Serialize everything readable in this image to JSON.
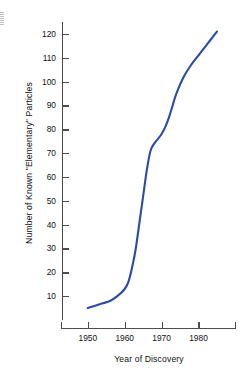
{
  "chart_data": {
    "type": "line",
    "title": "",
    "xlabel": "Year of Discovery",
    "ylabel": "Number of Known \"Elementary\" Particles",
    "xlim": [
      1943,
      1988
    ],
    "ylim": [
      0,
      125
    ],
    "xticks": [
      1950,
      1960,
      1970,
      1980
    ],
    "xtick_labels": [
      "1950",
      "1960",
      "1970",
      "1980"
    ],
    "yticks": [
      10,
      20,
      30,
      40,
      50,
      60,
      70,
      80,
      90,
      100,
      110,
      120
    ],
    "ytick_labels": [
      "10",
      "20",
      "30",
      "40",
      "50",
      "60",
      "70",
      "80",
      "90",
      "100",
      "110",
      "120"
    ],
    "grid": false,
    "legend": "none",
    "line_color": "#2B4BA8",
    "line_width": 2.1,
    "series": [
      {
        "name": "Known elementary particles",
        "x": [
          1950,
          1952,
          1954,
          1956,
          1958,
          1960,
          1961,
          1962,
          1963,
          1964,
          1965,
          1966,
          1967,
          1968,
          1969,
          1970,
          1971,
          1972,
          1973,
          1974,
          1976,
          1978,
          1980,
          1982,
          1985
        ],
        "y": [
          5,
          6,
          7,
          8,
          10,
          13,
          16,
          22,
          30,
          41,
          52,
          63,
          71,
          74,
          76,
          78,
          81,
          85,
          90,
          95,
          102,
          107,
          111,
          115,
          121
        ]
      }
    ]
  },
  "axes": {
    "y_axis_name": "y-axis",
    "x_axis_name": "x-axis"
  }
}
